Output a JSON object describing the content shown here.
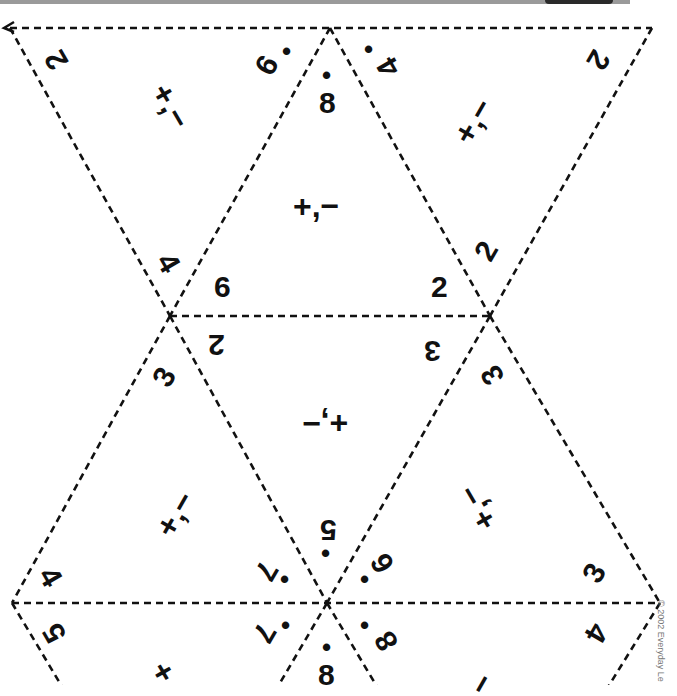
{
  "worksheet": {
    "type": "triangle-flexagon-cutout",
    "line_color": "#111111",
    "background": "#ffffff",
    "copyright": "© 2002 Everyday Le"
  },
  "triangles": [
    {
      "id": "top-left",
      "operation": "+,−",
      "numbers": [
        "2",
        "9•",
        "4"
      ]
    },
    {
      "id": "top-center",
      "operation": "+,−",
      "numbers": [
        "8•",
        "6",
        "2"
      ]
    },
    {
      "id": "top-right",
      "operation": "+,−",
      "numbers": [
        "4•",
        "2",
        "2"
      ]
    },
    {
      "id": "mid-center",
      "operation": "+,−",
      "numbers": [
        "2",
        "3",
        "5•"
      ]
    },
    {
      "id": "mid-left",
      "operation": "+,−",
      "numbers": [
        "3",
        "4",
        "7•"
      ]
    },
    {
      "id": "mid-right",
      "operation": "+,−",
      "numbers": [
        "3",
        "6•",
        "3"
      ]
    },
    {
      "id": "bottom-left",
      "operation": "+",
      "numbers": [
        "5",
        "7•",
        "8•"
      ]
    },
    {
      "id": "bottom-right",
      "operation": "−",
      "numbers": [
        "8•",
        "4"
      ]
    }
  ],
  "labels": {
    "tl_2": "2",
    "tl_9": "9",
    "tl_4": "4",
    "tl_op": "+,−",
    "tc_8": "8",
    "tc_6": "6",
    "tc_2": "2",
    "tc_op": "+,−",
    "tr_4": "4",
    "tr_2a": "2",
    "tr_2b": "2",
    "tr_op": "+,−",
    "mc_2": "2",
    "mc_3": "3",
    "mc_5": "5",
    "mc_op": "+,−",
    "ml_3": "3",
    "ml_4": "4",
    "ml_7": "7",
    "ml_op": "+,−",
    "mr_3a": "3",
    "mr_6": "6",
    "mr_3b": "3",
    "mr_op": "+,−",
    "bl_5": "5",
    "bl_7": "7",
    "bl_8": "8",
    "bl_op": "+",
    "br_8": "8",
    "br_4": "4",
    "br_op": "−",
    "dot": "•"
  }
}
